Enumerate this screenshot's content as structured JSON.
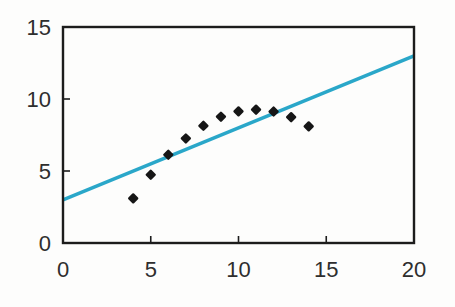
{
  "chart_data": {
    "type": "scatter",
    "title": "",
    "xlabel": "",
    "ylabel": "",
    "xlim": [
      0,
      20
    ],
    "ylim": [
      0,
      15
    ],
    "x_ticks": [
      0,
      5,
      10,
      15,
      20
    ],
    "y_ticks": [
      0,
      5,
      10,
      15
    ],
    "grid": false,
    "legend": false,
    "series": [
      {
        "name": "fitted-line",
        "type": "line",
        "color": "#2aa7c9",
        "x": [
          0,
          20
        ],
        "y": [
          3,
          13
        ]
      },
      {
        "name": "data-points",
        "type": "scatter",
        "marker": "diamond",
        "color": "#161616",
        "x": [
          4,
          5,
          6,
          7,
          8,
          9,
          10,
          11,
          12,
          13,
          14
        ],
        "y": [
          3.1,
          4.74,
          6.13,
          7.26,
          8.14,
          8.77,
          9.14,
          9.26,
          9.13,
          8.74,
          8.1
        ]
      }
    ]
  },
  "colors": {
    "background": "#fdfdfc",
    "axis": "#1c1c1c",
    "tick_label": "#2e2e2e",
    "line": "#2aa7c9",
    "marker": "#161616"
  }
}
